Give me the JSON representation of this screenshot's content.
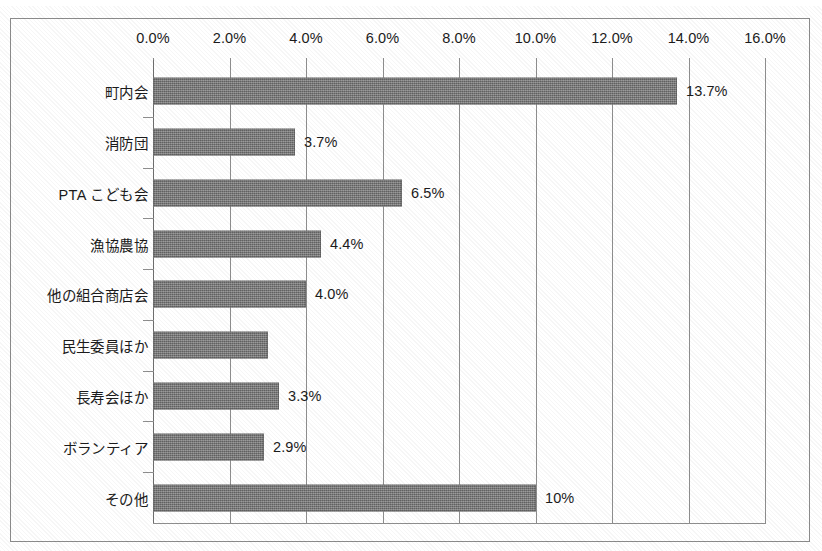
{
  "chart_data": {
    "type": "bar",
    "orientation": "horizontal",
    "title": "",
    "subtitle": "",
    "xlabel": "",
    "ylabel": "",
    "grid": true,
    "legend": null,
    "xlim": [
      0,
      16
    ],
    "xtick_labels": [
      "0.0%",
      "2.0%",
      "4.0%",
      "6.0%",
      "8.0%",
      "10.0%",
      "12.0%",
      "14.0%",
      "16.0%"
    ],
    "xtick_values": [
      0,
      2,
      4,
      6,
      8,
      10,
      12,
      14,
      16
    ],
    "categories": [
      "町内会",
      "消防団",
      "PTA こども会",
      "漁協農協",
      "他の組合商店会",
      "民生委員ほか",
      "長寿会ほか",
      "ボランティア",
      "その他"
    ],
    "values": [
      13.7,
      3.7,
      6.5,
      4.4,
      4.0,
      3.0,
      3.3,
      2.9,
      10.0
    ],
    "data_labels": [
      "13.7%",
      "3.7%",
      "6.5%",
      "4.4%",
      "4.0%",
      "",
      "3.3%",
      "2.9%",
      "10%"
    ],
    "bar_color": "#757575",
    "axis_color": "#8e8e8e",
    "text_color": "#1b1b1b",
    "background_color": "#ffffff"
  }
}
